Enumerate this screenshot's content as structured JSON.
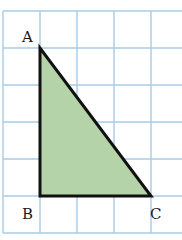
{
  "diagram": {
    "type": "right-triangle-on-grid",
    "grid": {
      "origin_x": 3,
      "origin_y": 11,
      "cell_size": 37,
      "columns": 5,
      "rows": 6,
      "line_color": "#a9cbe6"
    },
    "triangle": {
      "fill_color": "#b5d3a9",
      "stroke_color": "#111111",
      "vertices": {
        "A": {
          "grid_col": 1,
          "grid_row": 1
        },
        "B": {
          "grid_col": 1,
          "grid_row": 5
        },
        "C": {
          "grid_col": 4,
          "grid_row": 5
        }
      },
      "leg_AB_units": 4,
      "leg_BC_units": 3,
      "right_angle_at": "B"
    },
    "labels": {
      "A": "A",
      "B": "B",
      "C": "C"
    }
  }
}
